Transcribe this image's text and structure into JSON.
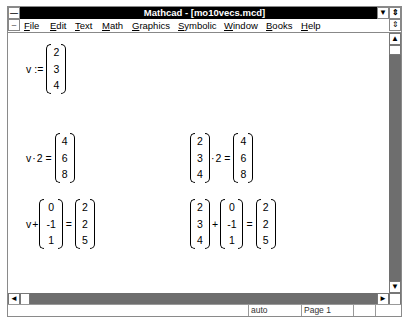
{
  "window": {
    "title": "Mathcad - [mo10vecs.mcd]",
    "system_menu_icon": "app-system-menu",
    "doc_system_menu_icon": "doc-system-menu",
    "minimize_icon": "minimize-arrow",
    "restore_icon": "restore-arrows"
  },
  "menu": [
    {
      "pre": "",
      "u": "F",
      "post": "ile"
    },
    {
      "pre": "",
      "u": "E",
      "post": "dit"
    },
    {
      "pre": "",
      "u": "T",
      "post": "ext"
    },
    {
      "pre": "",
      "u": "M",
      "post": "ath"
    },
    {
      "pre": "",
      "u": "G",
      "post": "raphics"
    },
    {
      "pre": "",
      "u": "S",
      "post": "ymbolic"
    },
    {
      "pre": "",
      "u": "W",
      "post": "indow"
    },
    {
      "pre": "",
      "u": "B",
      "post": "ooks"
    },
    {
      "pre": "",
      "u": "H",
      "post": "elp"
    }
  ],
  "document": {
    "def": {
      "lhs": "v",
      "op": ":=",
      "vec": [
        "2",
        "3",
        "4"
      ]
    },
    "scalar_mult_left": {
      "lhs": "v",
      "op1": "·",
      "scalar": "2",
      "eq": "=",
      "result": [
        "4",
        "6",
        "8"
      ]
    },
    "scalar_mult_right": {
      "vec": [
        "2",
        "3",
        "4"
      ],
      "op1": "·",
      "scalar": "2",
      "eq": "=",
      "result": [
        "4",
        "6",
        "8"
      ]
    },
    "add_left": {
      "lhs": "v",
      "op1": "+",
      "addend": [
        "0",
        "-1",
        "1"
      ],
      "eq": "=",
      "result": [
        "2",
        "2",
        "5"
      ]
    },
    "add_right": {
      "vec": [
        "2",
        "3",
        "4"
      ],
      "op1": "+",
      "addend": [
        "0",
        "-1",
        "1"
      ],
      "eq": "=",
      "result": [
        "2",
        "2",
        "5"
      ]
    }
  },
  "status": {
    "mode": "auto",
    "page": "Page 1",
    "cell3": "",
    "cell4": ""
  },
  "scroll": {
    "up_arrow": "▲",
    "down_arrow": "▼",
    "left_arrow": "◄",
    "right_arrow": "►"
  }
}
